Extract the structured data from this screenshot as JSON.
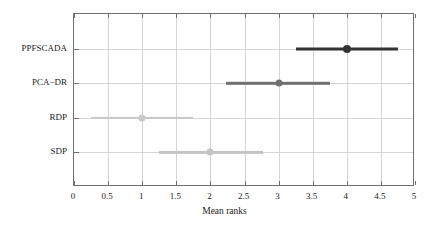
{
  "chart_data": {
    "type": "scatter",
    "title": "",
    "xlabel": "Mean ranks",
    "ylabel": "",
    "xlim": [
      0,
      5
    ],
    "grid": true,
    "legend": "none",
    "xticks": [
      "0",
      "0.5",
      "1",
      "1.5",
      "2",
      "2.5",
      "3",
      "3.5",
      "4",
      "4.5",
      "5"
    ],
    "xtick_values": [
      0,
      0.5,
      1,
      1.5,
      2,
      2.5,
      3,
      3.5,
      4,
      4.5,
      5
    ],
    "categories": [
      "PPFSCADA",
      "PCA−DR",
      "RDP",
      "SDP"
    ],
    "values": [
      4.0,
      3.0,
      1.0,
      2.0
    ],
    "ci_low": [
      3.25,
      2.23,
      0.25,
      1.25
    ],
    "ci_high": [
      4.75,
      3.75,
      1.75,
      2.77
    ],
    "series": [
      {
        "name": "PPFSCADA",
        "mean_rank": 4.0,
        "ci_low": 3.25,
        "ci_high": 4.75,
        "color": "#333333",
        "line_width": 3.0,
        "marker_size": 8
      },
      {
        "name": "PCA−DR",
        "mean_rank": 3.0,
        "ci_low": 2.23,
        "ci_high": 3.75,
        "color": "#707070",
        "line_width": 2.4,
        "marker_size": 7
      },
      {
        "name": "RDP",
        "mean_rank": 1.0,
        "ci_low": 0.25,
        "ci_high": 1.75,
        "color": "#c9c9c9",
        "line_width": 2.2,
        "marker_size": 7
      },
      {
        "name": "SDP",
        "mean_rank": 2.0,
        "ci_low": 1.25,
        "ci_high": 2.77,
        "color": "#c4c4c4",
        "line_width": 2.2,
        "marker_size": 7
      }
    ]
  },
  "axes": {
    "frame_color": "#6f6f6f",
    "grid_color": "#d4d4d4",
    "background": "#ffffff"
  }
}
